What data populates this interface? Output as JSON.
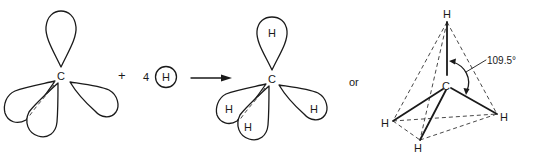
{
  "diagram": {
    "carbon_label": "C",
    "hydrogen_label": "H",
    "plus_sign": "+",
    "hydrogen_count": "4",
    "or_label": "or",
    "bond_angle": "109.5°",
    "left": {
      "name": "carbon sp3 orbitals",
      "center": "C"
    },
    "middle": {
      "name": "carbon sp3 orbitals with hydrogens",
      "center": "C",
      "lobe_labels": [
        "H",
        "H",
        "H",
        "H"
      ]
    },
    "right": {
      "name": "tetrahedral methane",
      "center": "C",
      "vertices": [
        "H",
        "H",
        "H",
        "H"
      ]
    }
  }
}
